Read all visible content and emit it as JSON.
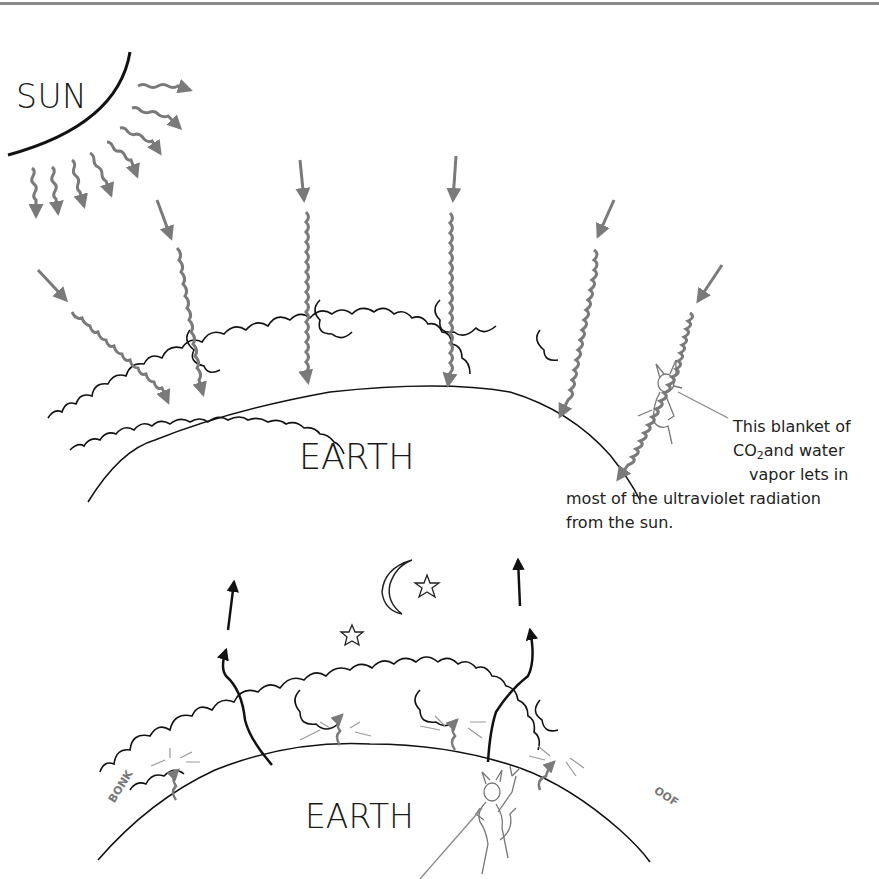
{
  "figure": {
    "colors": {
      "ink": "#1a1a1a",
      "radiation": "#7a7a7a",
      "background": "#ffffff",
      "rule": "#8a8a8a"
    },
    "top_panel": {
      "sun_label": "SUN",
      "earth_label": "EARTH",
      "caption": {
        "line1": "This blanket of",
        "line2_pre": "CO",
        "line2_sub": "2",
        "line2_post": "and water",
        "line3": "vapor lets in",
        "line4": "most of the ultraviolet radiation",
        "line5": "from the sun."
      },
      "incoming_rays": 6,
      "characters": [
        "devil-sitting-on-cloud"
      ]
    },
    "bottom_panel": {
      "earth_label": "EARTH",
      "sky_icons": [
        "moon",
        "star",
        "star"
      ],
      "onomatopoeia": {
        "left": "BONK",
        "right": "OOF"
      },
      "escaping_rays": 2,
      "bouncing_rays": 4,
      "characters": [
        "devil-standing-with-pitchfork"
      ]
    }
  }
}
